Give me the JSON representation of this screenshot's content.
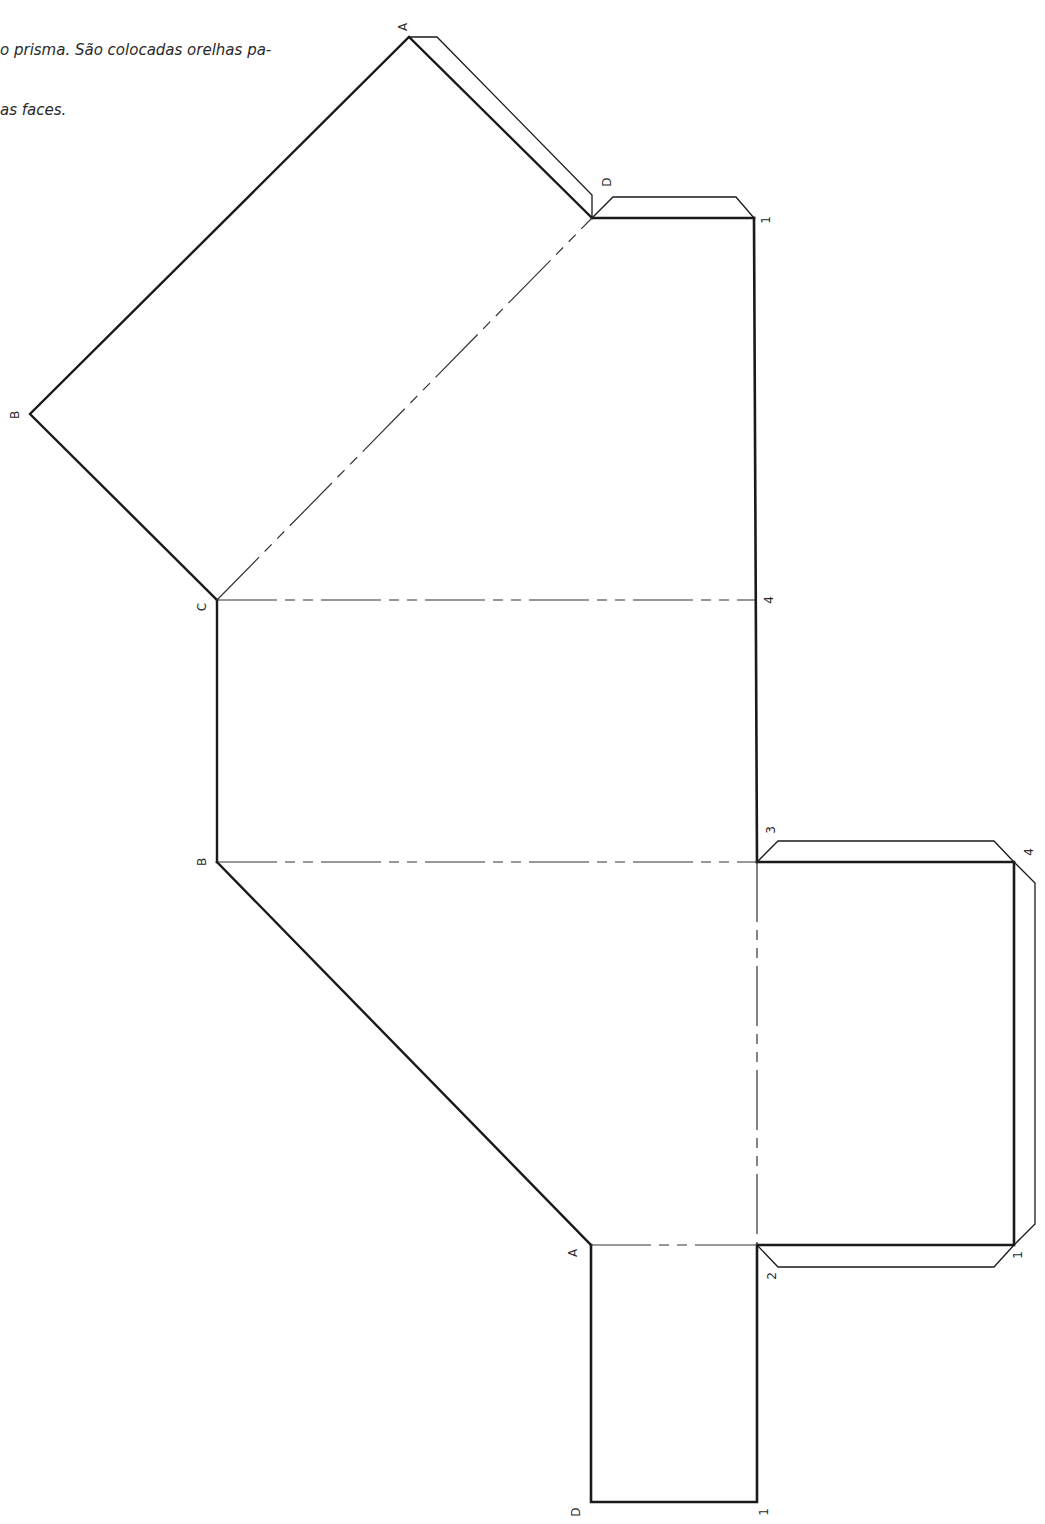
{
  "caption": {
    "line1": "o prisma. São colocadas orelhas pa-",
    "line2": "as faces."
  },
  "diagram": {
    "type": "prism-net",
    "labels": {
      "A_top": "A",
      "D_top": "D",
      "one_top": "1",
      "B_left": "B",
      "C_mid": "C",
      "four_mid": "4",
      "B_mid": "B",
      "three": "3",
      "four_right": "4",
      "A_bottom": "A",
      "two": "2",
      "one_right": "1",
      "D_bottom": "D",
      "one_bottom": "1"
    },
    "colors": {
      "line": "#1a1a1a",
      "fold": "#333333",
      "text": "#2a2a2a"
    }
  }
}
